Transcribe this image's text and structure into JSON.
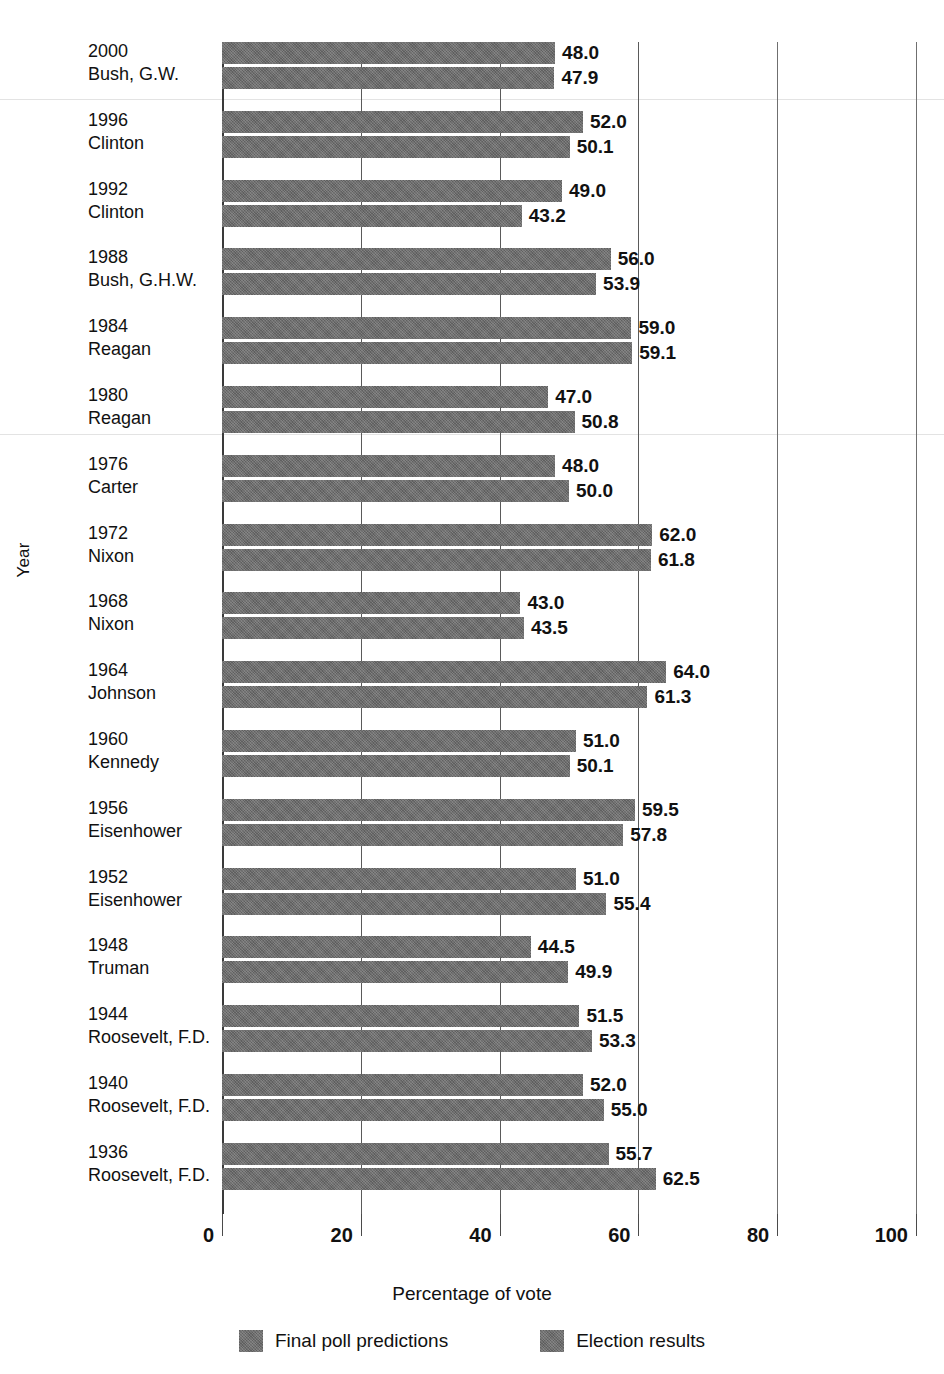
{
  "chart_data": {
    "type": "bar",
    "orientation": "horizontal",
    "title": "",
    "xlabel": "Percentage of vote",
    "ylabel": "Year",
    "xlim": [
      0,
      100
    ],
    "xticks": [
      0,
      20,
      40,
      60,
      80,
      100
    ],
    "xtick_labels": [
      "0",
      "20",
      "40",
      "60",
      "80",
      "100"
    ],
    "grid": true,
    "legend_position": "bottom",
    "categories": [
      "2000 Bush, G.W.",
      "1996 Clinton",
      "1992 Clinton",
      "1988 Bush, G.H.W.",
      "1984 Reagan",
      "1980 Reagan",
      "1976 Carter",
      "1972 Nixon",
      "1968 Nixon",
      "1964 Johnson",
      "1960 Kennedy",
      "1956 Eisenhower",
      "1952 Eisenhower",
      "1948 Truman",
      "1944 Roosevelt, F.D.",
      "1940 Roosevelt, F.D.",
      "1936 Roosevelt, F.D."
    ],
    "series": [
      {
        "name": "Final poll predictions",
        "values": [
          48.0,
          52.0,
          49.0,
          56.0,
          59.0,
          47.0,
          48.0,
          62.0,
          43.0,
          64.0,
          51.0,
          59.5,
          51.0,
          44.5,
          51.5,
          52.0,
          55.7
        ]
      },
      {
        "name": "Election results",
        "values": [
          47.9,
          50.1,
          43.2,
          53.9,
          59.1,
          50.8,
          50.0,
          61.8,
          43.5,
          61.3,
          50.1,
          57.8,
          55.4,
          49.9,
          53.3,
          55.0,
          62.5
        ]
      }
    ]
  },
  "rows": [
    {
      "year": "2000",
      "name": "Bush, G.W.",
      "poll": "48.0",
      "poll_v": 48.0,
      "result": "47.9",
      "result_v": 47.9
    },
    {
      "year": "1996",
      "name": "Clinton",
      "poll": "52.0",
      "poll_v": 52.0,
      "result": "50.1",
      "result_v": 50.1
    },
    {
      "year": "1992",
      "name": "Clinton",
      "poll": "49.0",
      "poll_v": 49.0,
      "result": "43.2",
      "result_v": 43.2
    },
    {
      "year": "1988",
      "name": "Bush, G.H.W.",
      "poll": "56.0",
      "poll_v": 56.0,
      "result": "53.9",
      "result_v": 53.9
    },
    {
      "year": "1984",
      "name": "Reagan",
      "poll": "59.0",
      "poll_v": 59.0,
      "result": "59.1",
      "result_v": 59.1
    },
    {
      "year": "1980",
      "name": "Reagan",
      "poll": "47.0",
      "poll_v": 47.0,
      "result": "50.8",
      "result_v": 50.8
    },
    {
      "year": "1976",
      "name": "Carter",
      "poll": "48.0",
      "poll_v": 48.0,
      "result": "50.0",
      "result_v": 50.0
    },
    {
      "year": "1972",
      "name": "Nixon",
      "poll": "62.0",
      "poll_v": 62.0,
      "result": "61.8",
      "result_v": 61.8
    },
    {
      "year": "1968",
      "name": "Nixon",
      "poll": "43.0",
      "poll_v": 43.0,
      "result": "43.5",
      "result_v": 43.5
    },
    {
      "year": "1964",
      "name": "Johnson",
      "poll": "64.0",
      "poll_v": 64.0,
      "result": "61.3",
      "result_v": 61.3
    },
    {
      "year": "1960",
      "name": "Kennedy",
      "poll": "51.0",
      "poll_v": 51.0,
      "result": "50.1",
      "result_v": 50.1
    },
    {
      "year": "1956",
      "name": "Eisenhower",
      "poll": "59.5",
      "poll_v": 59.5,
      "result": "57.8",
      "result_v": 57.8
    },
    {
      "year": "1952",
      "name": "Eisenhower",
      "poll": "51.0",
      "poll_v": 51.0,
      "result": "55.4",
      "result_v": 55.4
    },
    {
      "year": "1948",
      "name": "Truman",
      "poll": "44.5",
      "poll_v": 44.5,
      "result": "49.9",
      "result_v": 49.9
    },
    {
      "year": "1944",
      "name": "Roosevelt, F.D.",
      "poll": "51.5",
      "poll_v": 51.5,
      "result": "53.3",
      "result_v": 53.3
    },
    {
      "year": "1940",
      "name": "Roosevelt, F.D.",
      "poll": "52.0",
      "poll_v": 52.0,
      "result": "55.0",
      "result_v": 55.0
    },
    {
      "year": "1936",
      "name": "Roosevelt, F.D.",
      "poll": "55.7",
      "poll_v": 55.7,
      "result": "62.5",
      "result_v": 62.5
    }
  ],
  "axes": {
    "y_title": "Year",
    "x_title": "Percentage of vote",
    "x_ticks": [
      "0",
      "20",
      "40",
      "60",
      "80",
      "100"
    ]
  },
  "legend": {
    "items": [
      {
        "label": "Final poll predictions",
        "color": "#6b6b6b"
      },
      {
        "label": "Election results",
        "color": "#6b6b6b"
      }
    ]
  },
  "colors": {
    "bar": "#6b6b6b",
    "axis": "#3a3a3a",
    "grid": "#5a5a5a",
    "text": "#111111",
    "background": "#ffffff"
  }
}
